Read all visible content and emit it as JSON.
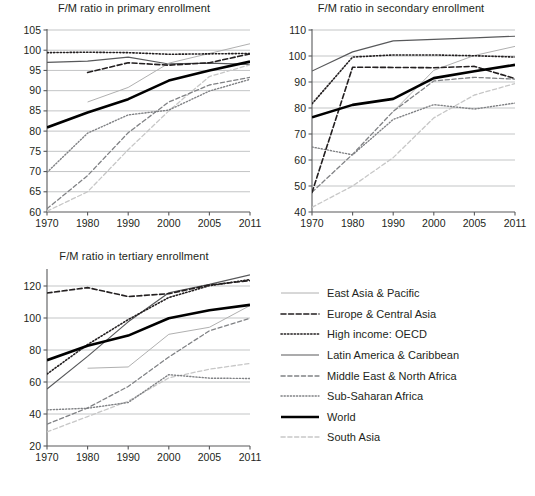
{
  "figure": {
    "background": "#ffffff",
    "axis_color": "#58595b",
    "grid_color": "#bcbec0"
  },
  "legend": {
    "name": "series-legend",
    "entries": [
      {
        "label": "East Asia & Pacific",
        "key": "east_asia_pacific",
        "style": "solid",
        "color": "#b0b0b0",
        "width": 1.0
      },
      {
        "label": "Europe & Central Asia",
        "key": "europe_central_asia",
        "style": "dashed",
        "color": "#231f20",
        "width": 1.6
      },
      {
        "label": "High income: OECD",
        "key": "high_income_oecd",
        "style": "dotted",
        "color": "#231f20",
        "width": 1.6
      },
      {
        "label": "Latin America & Caribbean",
        "key": "latin_america_caribbean",
        "style": "solid",
        "color": "#58595b",
        "width": 1.2
      },
      {
        "label": "Middle East & North Africa",
        "key": "middle_east_north_africa",
        "style": "dashed",
        "color": "#808285",
        "width": 1.3
      },
      {
        "label": "Sub-Saharan Africa",
        "key": "sub_saharan_africa",
        "style": "dotted",
        "color": "#808285",
        "width": 1.4
      },
      {
        "label": "World",
        "key": "world",
        "style": "solid",
        "color": "#000000",
        "width": 2.6
      },
      {
        "label": "South Asia",
        "key": "south_asia",
        "style": "dashed",
        "color": "#c7c7c7",
        "width": 1.3
      }
    ]
  },
  "chart_data": [
    {
      "id": "primary",
      "type": "line",
      "title": "F/M ratio in primary enrollment",
      "xlabel": "",
      "ylabel": "",
      "categories": [
        "1970",
        "1980",
        "1990",
        "2000",
        "2005",
        "2011"
      ],
      "yticks": [
        60,
        65,
        70,
        75,
        80,
        85,
        90,
        95,
        100,
        105
      ],
      "ylim": [
        60,
        105
      ],
      "grid": true,
      "legend_position": "external-right",
      "series": [
        {
          "name": "East Asia & Pacific",
          "values": [
            null,
            87.2,
            90.8,
            96.8,
            99.2,
            101.6
          ]
        },
        {
          "name": "Europe & Central Asia",
          "values": [
            null,
            94.5,
            96.9,
            96.3,
            96.9,
            99.1
          ]
        },
        {
          "name": "High income: OECD",
          "values": [
            99.4,
            99.5,
            99.4,
            99.0,
            99.1,
            99.2
          ]
        },
        {
          "name": "Latin America & Caribbean",
          "values": [
            97.0,
            97.3,
            98.3,
            96.6,
            96.8,
            96.5
          ]
        },
        {
          "name": "Middle East & North Africa",
          "values": [
            60.8,
            69.0,
            79.6,
            87.2,
            91.4,
            93.3
          ]
        },
        {
          "name": "Sub-Saharan Africa",
          "values": [
            69.8,
            79.5,
            84.0,
            85.2,
            89.9,
            92.8
          ]
        },
        {
          "name": "World",
          "values": [
            80.9,
            84.6,
            87.9,
            92.5,
            95.0,
            97.2
          ]
        },
        {
          "name": "South Asia",
          "values": [
            60.2,
            65.0,
            75.4,
            85.0,
            93.5,
            96.4
          ]
        }
      ]
    },
    {
      "id": "secondary",
      "type": "line",
      "title": "F/M ratio in secondary enrollment",
      "xlabel": "",
      "ylabel": "",
      "categories": [
        "1970",
        "1980",
        "1990",
        "2000",
        "2005",
        "2011"
      ],
      "yticks": [
        40,
        50,
        60,
        70,
        80,
        90,
        100,
        110
      ],
      "ylim": [
        40,
        110
      ],
      "grid": true,
      "legend_position": "external-right",
      "series": [
        {
          "name": "East Asia & Pacific",
          "values": [
            null,
            null,
            78.6,
            94.5,
            100.2,
            103.7
          ]
        },
        {
          "name": "Europe & Central Asia",
          "values": [
            47.5,
            95.7,
            95.6,
            95.5,
            96.0,
            91.3
          ]
        },
        {
          "name": "High income: OECD",
          "values": [
            81.6,
            99.6,
            100.4,
            100.4,
            100.1,
            99.6
          ]
        },
        {
          "name": "Latin America & Caribbean",
          "values": [
            94.2,
            101.6,
            105.8,
            106.4,
            107.0,
            107.6
          ]
        },
        {
          "name": "Middle East & North Africa",
          "values": [
            47.6,
            62.2,
            78.7,
            90.4,
            91.8,
            91.1
          ]
        },
        {
          "name": "Sub-Saharan Africa",
          "values": [
            65.0,
            62.0,
            75.6,
            81.3,
            79.6,
            81.9
          ]
        },
        {
          "name": "World",
          "values": [
            76.4,
            81.2,
            83.5,
            91.5,
            94.1,
            96.6
          ]
        },
        {
          "name": "South Asia",
          "values": [
            41.8,
            50.0,
            60.9,
            76.2,
            85.0,
            89.4
          ]
        }
      ]
    },
    {
      "id": "tertiary",
      "type": "line",
      "title": "F/M ratio in tertiary enrollment",
      "xlabel": "",
      "ylabel": "",
      "categories": [
        "1970",
        "1980",
        "1990",
        "2000",
        "2005",
        "2011"
      ],
      "yticks": [
        20,
        40,
        60,
        80,
        100,
        120
      ],
      "ylim": [
        20,
        130
      ],
      "grid": true,
      "legend_position": "external-right",
      "series": [
        {
          "name": "East Asia & Pacific",
          "values": [
            null,
            68.6,
            69.4,
            89.8,
            94.2,
            107.8
          ]
        },
        {
          "name": "Europe & Central Asia",
          "values": [
            115.6,
            119.0,
            113.4,
            115.2,
            120.6,
            123.4
          ]
        },
        {
          "name": "High income: OECD",
          "values": [
            65.0,
            83.4,
            99.0,
            112.8,
            120.2,
            124.0
          ]
        },
        {
          "name": "Latin America & Caribbean",
          "values": [
            55.6,
            76.0,
            97.6,
            115.8,
            121.0,
            127.0
          ]
        },
        {
          "name": "Middle East & North Africa",
          "values": [
            33.6,
            43.8,
            57.2,
            75.6,
            92.0,
            99.8
          ]
        },
        {
          "name": "Sub-Saharan Africa",
          "values": [
            42.6,
            43.6,
            47.2,
            64.6,
            62.4,
            62.2
          ]
        },
        {
          "name": "World",
          "values": [
            73.6,
            82.6,
            89.0,
            99.8,
            104.8,
            108.2
          ]
        },
        {
          "name": "South Asia",
          "values": [
            28.8,
            38.4,
            48.0,
            62.6,
            68.0,
            71.6
          ]
        }
      ]
    }
  ]
}
